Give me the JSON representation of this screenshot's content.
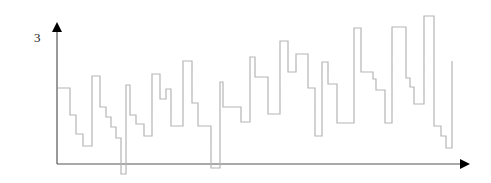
{
  "chart_data": {
    "type": "line",
    "subtype": "step",
    "title": "",
    "xlabel": "",
    "ylabel": "",
    "y_tick_labels": [
      "3"
    ],
    "grid": false,
    "legend": null,
    "colors": {
      "axis": "#555555",
      "arrow": "#000000",
      "line": "#b5b5b5"
    },
    "axes": {
      "origin_px": [
        57,
        164
      ],
      "x_end_px": 470,
      "y_end_px": 22
    },
    "series": [
      {
        "name": "signal",
        "points_px": [
          [
            58,
            88
          ],
          [
            70,
            88
          ],
          [
            70,
            115
          ],
          [
            76,
            115
          ],
          [
            76,
            134
          ],
          [
            83,
            134
          ],
          [
            83,
            146
          ],
          [
            92,
            146
          ],
          [
            92,
            76
          ],
          [
            100,
            76
          ],
          [
            100,
            107
          ],
          [
            106,
            107
          ],
          [
            106,
            117
          ],
          [
            111,
            117
          ],
          [
            111,
            127
          ],
          [
            116,
            127
          ],
          [
            116,
            138
          ],
          [
            121,
            138
          ],
          [
            121,
            174
          ],
          [
            126,
            174
          ],
          [
            126,
            85
          ],
          [
            130,
            85
          ],
          [
            130,
            115
          ],
          [
            136,
            115
          ],
          [
            136,
            124
          ],
          [
            144,
            124
          ],
          [
            144,
            136
          ],
          [
            152,
            136
          ],
          [
            152,
            74
          ],
          [
            160,
            74
          ],
          [
            160,
            99
          ],
          [
            166,
            99
          ],
          [
            166,
            89
          ],
          [
            171,
            89
          ],
          [
            171,
            126
          ],
          [
            183,
            126
          ],
          [
            183,
            61
          ],
          [
            192,
            61
          ],
          [
            192,
            103
          ],
          [
            198,
            103
          ],
          [
            198,
            126
          ],
          [
            211,
            126
          ],
          [
            211,
            168
          ],
          [
            220,
            168
          ],
          [
            220,
            82
          ],
          [
            223,
            82
          ],
          [
            223,
            107
          ],
          [
            241,
            107
          ],
          [
            241,
            122
          ],
          [
            250,
            122
          ],
          [
            250,
            57
          ],
          [
            255,
            57
          ],
          [
            255,
            77
          ],
          [
            268,
            77
          ],
          [
            268,
            114
          ],
          [
            280,
            114
          ],
          [
            280,
            41
          ],
          [
            288,
            41
          ],
          [
            288,
            72
          ],
          [
            296,
            72
          ],
          [
            296,
            54
          ],
          [
            308,
            54
          ],
          [
            308,
            88
          ],
          [
            315,
            88
          ],
          [
            315,
            136
          ],
          [
            322,
            136
          ],
          [
            322,
            62
          ],
          [
            328,
            62
          ],
          [
            328,
            84
          ],
          [
            337,
            84
          ],
          [
            337,
            123
          ],
          [
            354,
            123
          ],
          [
            354,
            28
          ],
          [
            361,
            28
          ],
          [
            361,
            72
          ],
          [
            373,
            72
          ],
          [
            373,
            79
          ],
          [
            376,
            79
          ],
          [
            376,
            90
          ],
          [
            385,
            90
          ],
          [
            385,
            123
          ],
          [
            392,
            123
          ],
          [
            392,
            27
          ],
          [
            406,
            27
          ],
          [
            406,
            78
          ],
          [
            410,
            78
          ],
          [
            410,
            87
          ],
          [
            414,
            87
          ],
          [
            414,
            104
          ],
          [
            424,
            104
          ],
          [
            424,
            16
          ],
          [
            434,
            16
          ],
          [
            434,
            126
          ],
          [
            441,
            126
          ],
          [
            441,
            136
          ],
          [
            446,
            136
          ],
          [
            446,
            148
          ],
          [
            452,
            148
          ],
          [
            452,
            61
          ]
        ]
      }
    ]
  },
  "labels": {
    "y_tick": "3"
  }
}
